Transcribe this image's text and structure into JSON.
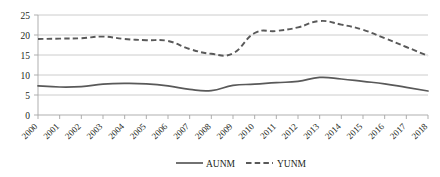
{
  "chart_data": {
    "type": "line",
    "title": "",
    "subtitle": "",
    "xlabel": "",
    "ylabel": "",
    "categories": [
      "2000",
      "2001",
      "2002",
      "2003",
      "2004",
      "2005",
      "2006",
      "2007",
      "2008",
      "2009",
      "2010",
      "2011",
      "2012",
      "2013",
      "2014",
      "2015",
      "2016",
      "2017",
      "2018"
    ],
    "x": [
      2000,
      2001,
      2002,
      2003,
      2004,
      2005,
      2006,
      2007,
      2008,
      2009,
      2010,
      2011,
      2012,
      2013,
      2014,
      2015,
      2016,
      2017,
      2018
    ],
    "series": [
      {
        "name": "AUNM",
        "style": "solid",
        "color": "#595959",
        "values": [
          7.3,
          7.0,
          7.1,
          7.7,
          7.9,
          7.8,
          7.3,
          6.4,
          6.1,
          7.4,
          7.7,
          8.1,
          8.4,
          9.4,
          9.0,
          8.4,
          7.8,
          6.9,
          6.0
        ]
      },
      {
        "name": "YUNM",
        "style": "dashed",
        "color": "#595959",
        "values": [
          19.0,
          19.1,
          19.2,
          19.6,
          19.0,
          18.7,
          18.5,
          16.5,
          15.3,
          15.4,
          20.5,
          21.0,
          21.9,
          23.5,
          22.6,
          21.3,
          19.2,
          17.0,
          14.8
        ]
      }
    ],
    "ylim": [
      0,
      25
    ],
    "yticks": [
      0,
      5,
      10,
      15,
      20,
      25
    ],
    "ytick_labels": [
      "0",
      "5",
      "10",
      "15",
      "20",
      "25"
    ],
    "grid": "horizontal",
    "legend_position": "bottom",
    "legend_entries": [
      {
        "label": "AUNM",
        "style": "solid"
      },
      {
        "label": "YUNM",
        "style": "dashed"
      }
    ],
    "colors": {
      "series_line": "#595959",
      "gridline": "#bfbfbf",
      "axis": "#a6a6a6",
      "text": "#231f20",
      "background": "#ffffff"
    }
  }
}
